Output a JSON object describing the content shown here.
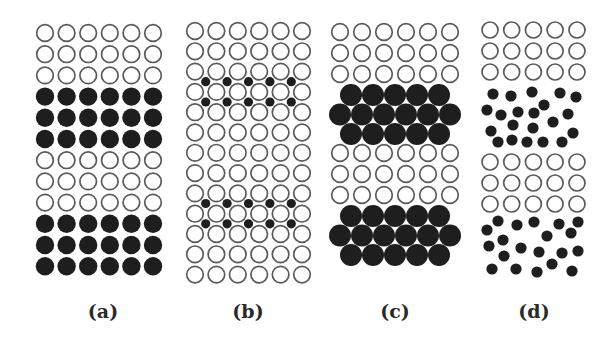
{
  "figure": {
    "width": 616,
    "height": 348,
    "colors": {
      "background": "#ffffff",
      "open_stroke": "#5a5a5a",
      "filled": "#1e1e1e",
      "label": "#2a2a2a"
    }
  },
  "panels": [
    {
      "id": "a",
      "label": "(a)",
      "label_x": 103,
      "label_y": 300,
      "description": "Ordered layered lattice: 3 open rows alternating with 3 filled rows",
      "grid": {
        "cols": [
          45,
          66.6,
          88.2,
          109.8,
          131.4,
          153
        ],
        "rows": [
          {
            "y": 33,
            "type": "open"
          },
          {
            "y": 54.2,
            "type": "open"
          },
          {
            "y": 75.4,
            "type": "open"
          },
          {
            "y": 96.6,
            "type": "filled"
          },
          {
            "y": 117.8,
            "type": "filled"
          },
          {
            "y": 139,
            "type": "filled"
          },
          {
            "y": 160.2,
            "type": "open"
          },
          {
            "y": 181.4,
            "type": "open"
          },
          {
            "y": 202.6,
            "type": "open"
          },
          {
            "y": 223.8,
            "type": "filled"
          },
          {
            "y": 245,
            "type": "filled"
          },
          {
            "y": 266.2,
            "type": "filled"
          }
        ],
        "open_r": 8.3,
        "filled_r": 9.2
      }
    },
    {
      "id": "b",
      "label": "(b)",
      "label_x": 248,
      "label_y": 300,
      "description": "Open-circle lattice with small filled interstitial atoms between selected rows",
      "grid": {
        "cols": [
          195,
          216.4,
          237.8,
          259.2,
          280.6,
          302
        ],
        "rows": [
          31,
          51.3,
          71.6,
          91.9,
          112.2,
          132.5,
          152.8,
          173.1,
          193.4,
          213.7,
          234,
          254.3,
          274.6
        ],
        "open_r": 8.3
      },
      "interstitials": {
        "r": 4.6,
        "x": [
          205.7,
          227.1,
          248.5,
          269.9,
          291.3
        ],
        "rows_y": [
          81.7,
          102,
          203.5,
          223.8
        ]
      }
    },
    {
      "id": "c",
      "label": "(c)",
      "label_x": 395,
      "label_y": 300,
      "description": "Open-circle rows alternating with blocks of larger close-packed filled atoms (5-6-5)",
      "open_grid": {
        "cols": [
          340,
          362,
          384,
          406,
          428,
          450
        ],
        "rows": [
          32,
          53,
          74,
          153,
          174,
          195
        ],
        "r": 8.3
      },
      "filled_blocks": [
        {
          "rows": [
            {
              "y": 95,
              "xs": [
                351,
                373,
                395,
                417,
                439
              ]
            },
            {
              "y": 114.5,
              "xs": [
                340,
                362,
                384,
                406,
                428,
                450
              ]
            },
            {
              "y": 134,
              "xs": [
                351,
                373,
                395,
                417,
                439
              ]
            }
          ]
        },
        {
          "rows": [
            {
              "y": 216,
              "xs": [
                351,
                373,
                395,
                417,
                439
              ]
            },
            {
              "y": 235.5,
              "xs": [
                340,
                362,
                384,
                406,
                428,
                450
              ]
            },
            {
              "y": 255,
              "xs": [
                351,
                373,
                395,
                417,
                439
              ]
            }
          ]
        }
      ],
      "filled_r": 11
    },
    {
      "id": "d",
      "label": "(d)",
      "label_x": 534,
      "label_y": 300,
      "description": "Open-circle rows alternating with regions of randomly distributed small filled atoms",
      "open_grid": {
        "cols": [
          490,
          511.7,
          533.4,
          555.1,
          577
        ],
        "rows": [
          30,
          51,
          72,
          162,
          183,
          204
        ],
        "r": 8
      },
      "scatter_r": 5.6,
      "scatter": [
        [
          493,
          94
        ],
        [
          511,
          96
        ],
        [
          532,
          92
        ],
        [
          560,
          93
        ],
        [
          576,
          97
        ],
        [
          487,
          110
        ],
        [
          501,
          115
        ],
        [
          518,
          112
        ],
        [
          534,
          113
        ],
        [
          544,
          105
        ],
        [
          568,
          114
        ],
        [
          491,
          131
        ],
        [
          513,
          125
        ],
        [
          533,
          128
        ],
        [
          553,
          122
        ],
        [
          573,
          133
        ],
        [
          498,
          142
        ],
        [
          512,
          140
        ],
        [
          527,
          142
        ],
        [
          543,
          142
        ],
        [
          562,
          142
        ],
        [
          498,
          221
        ],
        [
          517,
          225
        ],
        [
          534,
          222
        ],
        [
          559,
          224
        ],
        [
          578,
          222
        ],
        [
          487,
          230
        ],
        [
          547,
          236
        ],
        [
          571,
          233
        ],
        [
          503,
          240
        ],
        [
          489,
          246
        ],
        [
          521,
          248
        ],
        [
          539,
          252
        ],
        [
          562,
          253
        ],
        [
          578,
          251
        ],
        [
          504,
          256
        ],
        [
          552,
          264
        ],
        [
          492,
          269
        ],
        [
          516,
          269
        ],
        [
          537,
          272
        ],
        [
          572,
          271
        ]
      ]
    }
  ]
}
